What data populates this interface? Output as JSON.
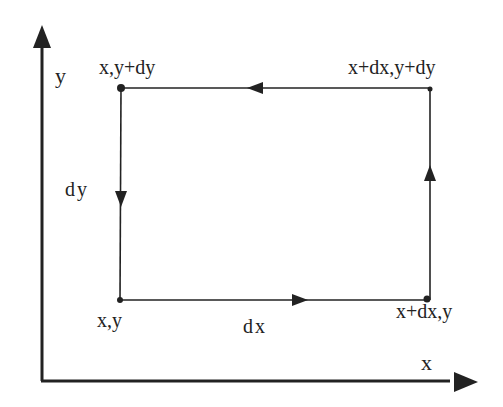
{
  "diagram": {
    "type": "coordinate-loop",
    "axes": {
      "x_label": "x",
      "y_label": "y"
    },
    "corners": {
      "bottom_left": "x,y",
      "top_left": "x,y+dy",
      "top_right": "x+dx,y+dy",
      "bottom_right": "x+dx,y"
    },
    "edges": {
      "bottom": "dx",
      "left": "dy"
    },
    "colors": {
      "ink": "#222222",
      "background": "#ffffff"
    }
  }
}
